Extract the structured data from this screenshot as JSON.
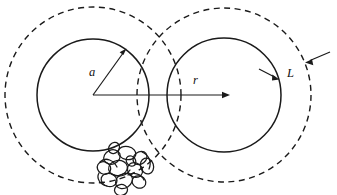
{
  "figure": {
    "type": "scientific-diagram",
    "background_color": "#ffffff",
    "line_color": "#1a1a1a",
    "width": 337,
    "height": 195
  },
  "labels": {
    "radius_a": "a",
    "radius_r": "r",
    "shell_L": "L"
  },
  "geometry": {
    "left_sphere": {
      "center_x": 93,
      "center_y": 95,
      "solid_radius": 56,
      "dashed_radius": 88
    },
    "right_sphere": {
      "center_x": 224,
      "center_y": 95,
      "solid_radius": 57,
      "dashed_radius": 87
    },
    "arrow_a": {
      "from_x": 93,
      "from_y": 95,
      "to_x": 125,
      "to_y": 50
    },
    "arrow_r": {
      "from_x": 93,
      "from_y": 95,
      "to_x": 229,
      "to_y": 95
    },
    "shell_arrows": {
      "inner_tip_x": 278,
      "inner_tip_y": 79,
      "outer_tip_x": 306,
      "outer_tip_y": 62
    }
  },
  "styles": {
    "dash_pattern": "6 4.5",
    "solid_stroke_width": 1.5,
    "dashed_stroke_width": 1.4
  }
}
